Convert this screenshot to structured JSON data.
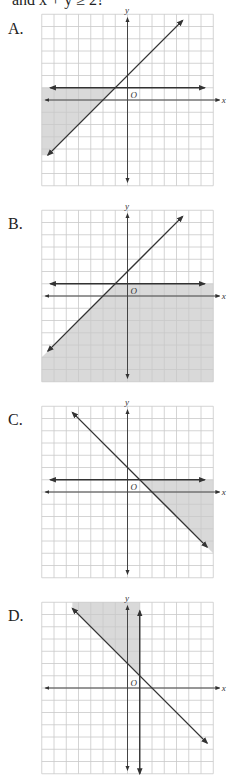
{
  "question": {
    "text_tail": "and x + y ≥ 2?"
  },
  "graph_style": {
    "grid_color": "#c9c9c9",
    "shade_color": "#d9d9d9",
    "line_color": "#333333",
    "axis_color": "#444444",
    "cell_px": 12.25,
    "grid_range": [
      -7,
      7
    ]
  },
  "choices": [
    {
      "label": "A.",
      "top": 15,
      "origin": [
        127.5,
        100
      ],
      "axis_labels": {
        "x": "x",
        "y": "y",
        "origin": "O"
      },
      "lines": [
        {
          "name": "horizontal-line-y1",
          "from": [
            -6.3,
            1
          ],
          "to": [
            6.3,
            1
          ]
        },
        {
          "name": "diagonal-line",
          "from": [
            -6.5,
            -4.5
          ],
          "to": [
            4.5,
            6.5
          ]
        }
      ],
      "shade": [
        [
          -7,
          1
        ],
        [
          -1,
          1
        ],
        [
          -6.5,
          -4.5
        ],
        [
          -7,
          -4.5
        ]
      ]
    },
    {
      "label": "B.",
      "top": 210,
      "origin": [
        127.5,
        296
      ],
      "axis_labels": {
        "x": "x",
        "y": "y",
        "origin": "O"
      },
      "lines": [
        {
          "name": "horizontal-line-y1",
          "from": [
            -6.3,
            1
          ],
          "to": [
            6.3,
            1
          ]
        },
        {
          "name": "diagonal-line",
          "from": [
            -6.5,
            -4.5
          ],
          "to": [
            4.5,
            6.5
          ]
        }
      ],
      "shade": [
        [
          -1,
          1
        ],
        [
          7,
          1
        ],
        [
          7,
          -7
        ],
        [
          -7,
          -7
        ],
        [
          -7,
          -5
        ],
        [
          -6.5,
          -4.5
        ]
      ]
    },
    {
      "label": "C.",
      "top": 406,
      "origin": [
        127.5,
        492
      ],
      "axis_labels": {
        "x": "x",
        "y": "y",
        "origin": "O"
      },
      "lines": [
        {
          "name": "horizontal-line-y1",
          "from": [
            -6.3,
            1
          ],
          "to": [
            6.3,
            1
          ]
        },
        {
          "name": "diagonal-line",
          "from": [
            -4.5,
            6.5
          ],
          "to": [
            6.5,
            -4.5
          ]
        }
      ],
      "shade": [
        [
          1,
          1
        ],
        [
          7,
          1
        ],
        [
          7,
          -5
        ],
        [
          6.5,
          -4.5
        ]
      ]
    },
    {
      "label": "D.",
      "top": 602,
      "origin": [
        127.5,
        688
      ],
      "axis_labels": {
        "x": "x",
        "y": "y",
        "origin": "O"
      },
      "lines": [
        {
          "name": "vertical-line-x1",
          "from": [
            1,
            -7
          ],
          "to": [
            1,
            6.3
          ]
        },
        {
          "name": "diagonal-line",
          "from": [
            -4.5,
            6.5
          ],
          "to": [
            6.5,
            -4.5
          ]
        }
      ],
      "shade": [
        [
          -4.5,
          7
        ],
        [
          1,
          7
        ],
        [
          1,
          1
        ],
        [
          -4.5,
          6.5
        ]
      ]
    }
  ]
}
